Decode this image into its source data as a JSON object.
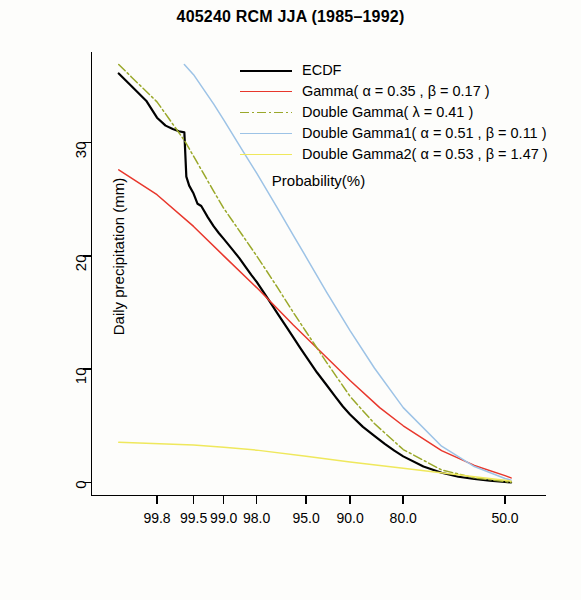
{
  "chart_data": {
    "type": "line",
    "title": "405240 RCM JJA (1985–1992)",
    "xlabel": "Probability(%)",
    "ylabel": "Daily precipitation (mm)",
    "xtick_labels": [
      "99.8",
      "99.5",
      "99.0",
      "98.0",
      "95.0",
      "90.0",
      "80.0",
      "50.0"
    ],
    "xtick_values": [
      99.8,
      99.5,
      99.0,
      98.0,
      95.0,
      90.0,
      80.0,
      50.0
    ],
    "ytick_labels": [
      "0",
      "10",
      "20",
      "30"
    ],
    "ytick_values": [
      0,
      10,
      20,
      30
    ],
    "ylim": [
      -1.2,
      38.0
    ],
    "grid": false,
    "legend_position": "top-center",
    "series": [
      {
        "name": "ECDF",
        "color": "#000000",
        "x": [
          99.93,
          99.9,
          99.85,
          99.8,
          99.75,
          99.7,
          99.65,
          99.6,
          99.58,
          99.55,
          99.5,
          99.45,
          99.4,
          99.3,
          99.2,
          99.1,
          99.0,
          98.8,
          98.6,
          98.4,
          98.2,
          98.0,
          97.5,
          97.0,
          96.5,
          96.0,
          95.5,
          95.0,
          94.0,
          93.0,
          92.0,
          91.0,
          90.0,
          88.0,
          86.0,
          84.0,
          82.0,
          80.0,
          75.0,
          70.0,
          65.0,
          60.0,
          55.0,
          52.0,
          50.0,
          48.0
        ],
        "y": [
          36.1,
          35.0,
          33.7,
          32.2,
          31.5,
          31.2,
          31.0,
          30.9,
          27.0,
          26.2,
          25.5,
          24.6,
          24.4,
          23.4,
          22.6,
          22.0,
          21.5,
          20.6,
          19.8,
          19.0,
          18.3,
          17.7,
          16.2,
          14.9,
          13.8,
          12.8,
          11.9,
          11.1,
          9.7,
          8.6,
          7.6,
          6.7,
          6.0,
          4.9,
          4.1,
          3.4,
          2.8,
          2.3,
          1.4,
          0.85,
          0.5,
          0.3,
          0.15,
          0.08,
          0.05,
          0.0
        ]
      },
      {
        "name": "Gamma( α = 0.35 , β = 0.17 )",
        "color": "#e8372c",
        "x": [
          99.93,
          99.8,
          99.5,
          99.0,
          98.0,
          96.0,
          95.0,
          92.0,
          90.0,
          85.0,
          80.0,
          70.0,
          60.0,
          50.0,
          48.0
        ],
        "y": [
          27.6,
          25.4,
          22.6,
          20.0,
          17.2,
          13.9,
          12.8,
          10.3,
          9.0,
          6.6,
          5.0,
          2.8,
          1.5,
          0.6,
          0.4
        ]
      },
      {
        "name": "Double Gamma( λ = 0.41 )",
        "color": "#9aa82a",
        "x": [
          99.93,
          99.9,
          99.8,
          99.6,
          99.5,
          99.2,
          99.0,
          98.5,
          98.0,
          97.0,
          96.0,
          95.0,
          93.0,
          90.0,
          86.0,
          80.0,
          70.0,
          60.0,
          50.0,
          48.0
        ],
        "y": [
          36.9,
          35.8,
          33.6,
          30.2,
          28.8,
          25.7,
          24.2,
          21.8,
          20.0,
          17.2,
          15.0,
          13.3,
          10.6,
          7.6,
          5.2,
          2.9,
          1.1,
          0.4,
          0.08,
          0.0
        ]
      },
      {
        "name": "Double Gamma1( α = 0.51 , β = 0.11 )",
        "color": "#9dc3e6",
        "x": [
          99.6,
          99.5,
          99.2,
          99.0,
          98.5,
          98.0,
          97.0,
          96.0,
          95.0,
          93.0,
          90.0,
          86.0,
          80.0,
          70.0,
          60.0,
          50.0,
          48.0
        ],
        "y": [
          36.9,
          36.0,
          33.4,
          32.0,
          29.3,
          27.3,
          24.2,
          21.8,
          19.9,
          16.8,
          13.4,
          10.1,
          6.6,
          3.2,
          1.4,
          0.35,
          0.2
        ]
      },
      {
        "name": "Double Gamma2( α = 0.53 , β = 1.47 )",
        "color": "#efe85c",
        "x": [
          99.93,
          99.5,
          99.0,
          98.0,
          95.0,
          90.0,
          80.0,
          60.0,
          50.0,
          48.0
        ],
        "y": [
          3.55,
          3.3,
          3.1,
          2.85,
          2.3,
          1.8,
          1.25,
          0.5,
          0.2,
          0.1
        ]
      }
    ],
    "legend_entries": [
      {
        "label": "ECDF",
        "color": "#000000",
        "style": "solid",
        "width": 2.2
      },
      {
        "label": "Gamma( α = 0.35 , β = 0.17 )",
        "color": "#e8372c",
        "style": "solid",
        "width": 1.6
      },
      {
        "label": "Double Gamma( λ = 0.41 )",
        "color": "#9aa82a",
        "style": "dashdot",
        "width": 1.6
      },
      {
        "label": "Double Gamma1( α = 0.51 , β = 0.11 )",
        "color": "#9dc3e6",
        "style": "solid",
        "width": 1.4
      },
      {
        "label": "Double Gamma2( α = 0.53 , β = 1.47 )",
        "color": "#efe85c",
        "style": "solid",
        "width": 1.6
      }
    ]
  }
}
